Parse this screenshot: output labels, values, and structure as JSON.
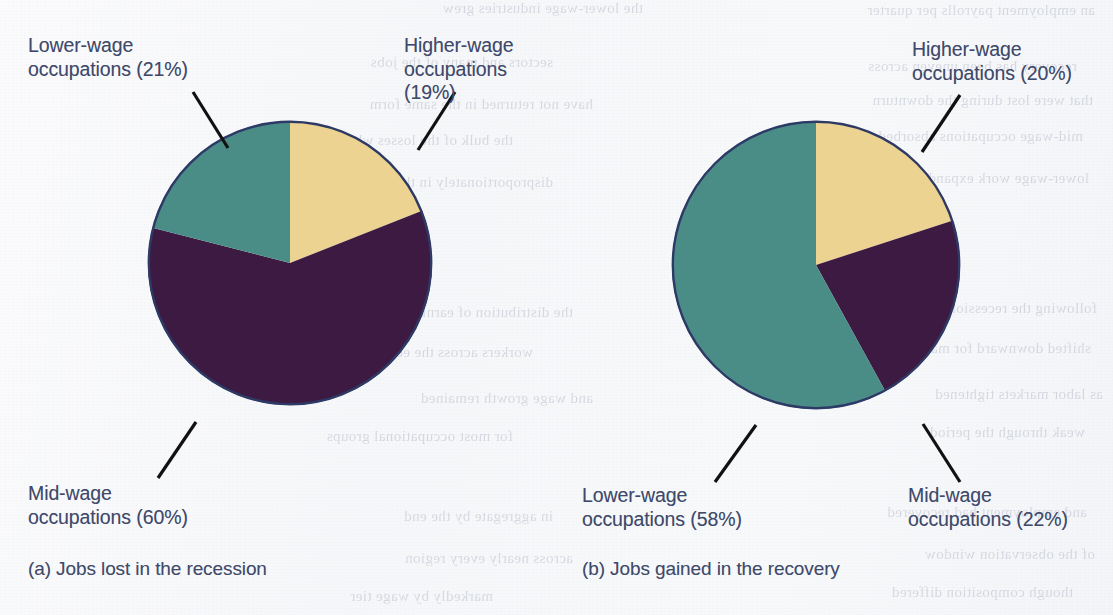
{
  "figure": {
    "background_color": "#f7f8fa",
    "text_color": "#3f4a6b",
    "slice_stroke_color": "#2e3a66",
    "leader_line_color": "#111111"
  },
  "palette": {
    "higher_wage": "#ecd392",
    "mid_wage": "#3d1a42",
    "lower_wage": "#4a8d87"
  },
  "panels": [
    {
      "id": "a",
      "caption": "(a) Jobs lost in the recession",
      "labels": {
        "lower": "Lower-wage\noccupations (21%)",
        "higher": "Higher-wage\noccupations (19%)",
        "mid": "Mid-wage\noccupations (60%)"
      }
    },
    {
      "id": "b",
      "caption": "(b) Jobs gained in the recovery",
      "labels": {
        "higher": "Higher-wage\noccupations (20%)",
        "lower": "Lower-wage\noccupations (58%)",
        "mid": "Mid-wage\noccupations (22%)"
      }
    }
  ],
  "bleed_through": [
    {
      "text": "an employment payrolls per quarter",
      "x": 18,
      "y": 2
    },
    {
      "text": "the lower-wage industries grew",
      "x": 470,
      "y": 0
    },
    {
      "text": "recovery has been uneven across",
      "x": 36,
      "y": 58
    },
    {
      "text": "sectors and many of the jobs",
      "x": 560,
      "y": 54
    },
    {
      "text": "that were lost during the downturn",
      "x": 20,
      "y": 92
    },
    {
      "text": "have not returned in the same form",
      "x": 520,
      "y": 96
    },
    {
      "text": "mid-wage occupations absorbed",
      "x": 30,
      "y": 128
    },
    {
      "text": "the bulk of the losses while",
      "x": 600,
      "y": 132
    },
    {
      "text": "lower-wage work expanded",
      "x": 24,
      "y": 170
    },
    {
      "text": "disproportionately in the years",
      "x": 560,
      "y": 174
    },
    {
      "text": "following the recession and",
      "x": 16,
      "y": 300
    },
    {
      "text": "the distribution of earnings",
      "x": 540,
      "y": 304
    },
    {
      "text": "shifted downward for many",
      "x": 22,
      "y": 340
    },
    {
      "text": "workers across the economy",
      "x": 580,
      "y": 344
    },
    {
      "text": "as labor markets tightened",
      "x": 10,
      "y": 386
    },
    {
      "text": "and wage growth remained",
      "x": 520,
      "y": 390
    },
    {
      "text": "weak through the period",
      "x": 28,
      "y": 424
    },
    {
      "text": "for most occupational groups",
      "x": 600,
      "y": 428
    },
    {
      "text": "and employment had recovered",
      "x": 26,
      "y": 504
    },
    {
      "text": "in aggregate by the end",
      "x": 560,
      "y": 508
    },
    {
      "text": "of the observation window",
      "x": 18,
      "y": 546
    },
    {
      "text": "across nearly every region",
      "x": 540,
      "y": 550
    },
    {
      "text": "though composition differed",
      "x": 40,
      "y": 584
    },
    {
      "text": "markedly by wage tier",
      "x": 620,
      "y": 588
    }
  ],
  "chart_data": [
    {
      "type": "pie",
      "title": "(a) Jobs lost in the recession",
      "categories": [
        "Higher-wage occupations",
        "Mid-wage occupations",
        "Lower-wage occupations"
      ],
      "values": [
        19,
        60,
        21
      ],
      "unit": "percent",
      "colors": [
        "#ecd392",
        "#3d1a42",
        "#4a8d87"
      ],
      "start_angle_deg": 0,
      "direction": "clockwise",
      "labels": [
        "Higher-wage occupations (19%)",
        "Mid-wage occupations (60%)",
        "Lower-wage occupations (21%)"
      ],
      "legend": "none",
      "grid": false,
      "center": {
        "x": 290,
        "y": 263
      },
      "radius": 142
    },
    {
      "type": "pie",
      "title": "(b) Jobs gained in the recovery",
      "categories": [
        "Higher-wage occupations",
        "Mid-wage occupations",
        "Lower-wage occupations"
      ],
      "values": [
        20,
        22,
        58
      ],
      "unit": "percent",
      "colors": [
        "#ecd392",
        "#3d1a42",
        "#4a8d87"
      ],
      "start_angle_deg": 0,
      "direction": "clockwise",
      "labels": [
        "Higher-wage occupations (20%)",
        "Mid-wage occupations (22%)",
        "Lower-wage occupations (58%)"
      ],
      "legend": "none",
      "grid": false,
      "center": {
        "x": 816,
        "y": 265
      },
      "radius": 144
    }
  ]
}
